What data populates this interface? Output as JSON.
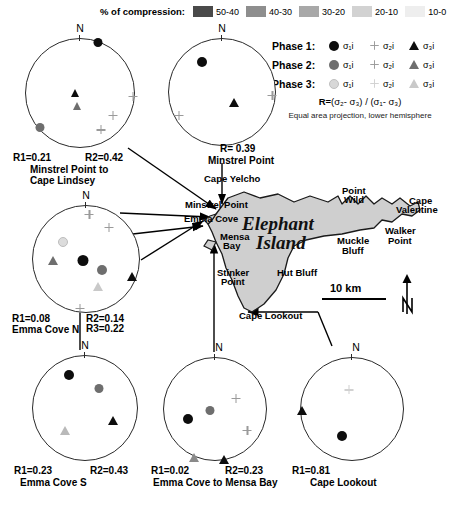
{
  "compression_legend": {
    "title": "% of compression:",
    "items": [
      {
        "label": "50-40",
        "color": "#4a4a4a"
      },
      {
        "label": "40-30",
        "color": "#8e8e8e"
      },
      {
        "label": "30-20",
        "color": "#a8a8a8"
      },
      {
        "label": "20-10",
        "color": "#d2d2d2"
      },
      {
        "label": "10-0",
        "color": "#eeeeee"
      }
    ]
  },
  "phase_legend": {
    "rows": [
      {
        "name": "Phase 1:",
        "s1": "σ₁i",
        "s2": "σ₂i",
        "s3": "σ₃i",
        "circle_color": "#0d0d0d",
        "plus_color": "#0d0d0d",
        "triangle_color": "#0d0d0d"
      },
      {
        "name": "Phase 2:",
        "s1": "σ₁i",
        "s2": "σ₂i",
        "s3": "σ₃i",
        "circle_color": "#6e6e6e",
        "plus_color": "#6e6e6e",
        "triangle_color": "#6e6e6e"
      },
      {
        "name": "Phase 3:",
        "s1": "σ₁i",
        "s2": "σ₂i",
        "s3": "σ₃i",
        "circle_color": "#d8d8d8",
        "plus_color": "#c8c8c8",
        "triangle_color": "#c9c9c9"
      }
    ],
    "formula_prefix": "R=",
    "formula_body": "(σ₂- σ₃) / (σ₁- σ₃)",
    "projection_note": "Equal area projection, lower hemisphere"
  },
  "stereonets": [
    {
      "id": "minstrel-point-to-cape-lindsey",
      "north_label": "N",
      "captions": [
        "R1=0.21",
        "R2=0.42"
      ],
      "name_lines": [
        "Minstrel Point to",
        "Cape Lindsey"
      ],
      "symbols": [
        {
          "type": "circle",
          "phase": 1,
          "x": 0.33,
          "y": -0.92
        },
        {
          "type": "triangle",
          "phase": 1,
          "x": -0.1,
          "y": -0.02
        },
        {
          "type": "triangle",
          "phase": 2,
          "x": -0.06,
          "y": 0.22
        },
        {
          "type": "circle",
          "phase": 2,
          "x": -0.73,
          "y": 0.62
        },
        {
          "type": "plus",
          "phase": 1,
          "x": 0.96,
          "y": 0.05
        },
        {
          "type": "plus",
          "phase": 2,
          "x": 0.6,
          "y": 0.4
        },
        {
          "type": "plus",
          "phase": 1,
          "x": 0.38,
          "y": 0.66
        }
      ]
    },
    {
      "id": "minstrel-point",
      "north_label": "N",
      "captions": [
        "R= 0.39"
      ],
      "name_lines": [
        "Minstrel Point"
      ],
      "symbols": [
        {
          "type": "circle",
          "phase": 1,
          "x": -0.37,
          "y": -0.55
        },
        {
          "type": "triangle",
          "phase": 1,
          "x": 0.22,
          "y": 0.18
        },
        {
          "type": "plus",
          "phase": 1,
          "x": 0.93,
          "y": 0.05
        },
        {
          "type": "plus",
          "phase": 1,
          "x": -0.8,
          "y": 0.42
        }
      ]
    },
    {
      "id": "emma-cove-n",
      "north_label": "N",
      "captions": [
        "R1=0.08",
        "R2=0.14",
        "R3=0.22"
      ],
      "name_lines": [
        "Emma Cove N"
      ],
      "symbols": [
        {
          "type": "circle",
          "phase": 3,
          "x": -0.42,
          "y": -0.32
        },
        {
          "type": "triangle",
          "phase": 2,
          "x": -0.62,
          "y": 0.02
        },
        {
          "type": "circle",
          "phase": 1,
          "x": -0.06,
          "y": 0.03
        },
        {
          "type": "circle",
          "phase": 2,
          "x": 0.3,
          "y": 0.2
        },
        {
          "type": "triangle",
          "phase": 1,
          "x": 0.86,
          "y": 0.32
        },
        {
          "type": "triangle",
          "phase": 3,
          "x": 0.22,
          "y": 0.5
        },
        {
          "type": "plus",
          "phase": 1,
          "x": 0.06,
          "y": -0.84
        },
        {
          "type": "plus",
          "phase": 2,
          "x": 0.42,
          "y": -0.6
        },
        {
          "type": "plus",
          "phase": 1,
          "x": -0.12,
          "y": 0.9
        }
      ]
    },
    {
      "id": "emma-cove-s",
      "north_label": "N",
      "captions": [
        "R1=0.23",
        "R2=0.43"
      ],
      "name_lines": [
        "Emma Cove S"
      ],
      "symbols": [
        {
          "type": "circle",
          "phase": 1,
          "x": -0.3,
          "y": -0.62
        },
        {
          "type": "circle",
          "phase": 2,
          "x": 0.26,
          "y": -0.38
        },
        {
          "type": "triangle",
          "phase": 1,
          "x": 0.52,
          "y": 0.22
        },
        {
          "type": "triangle",
          "phase": 3,
          "x": -0.38,
          "y": 0.42
        }
      ]
    },
    {
      "id": "emma-cove-to-mensa-bay",
      "north_label": "N",
      "captions": [
        "R1=0.02",
        "R2=0.23"
      ],
      "name_lines": [
        "Emma Cove to Mensa Bay"
      ],
      "symbols": [
        {
          "type": "circle",
          "phase": 2,
          "x": -0.1,
          "y": 0.02
        },
        {
          "type": "circle",
          "phase": 1,
          "x": -0.52,
          "y": 0.2
        },
        {
          "type": "plus",
          "phase": 1,
          "x": 0.4,
          "y": -0.22
        },
        {
          "type": "plus",
          "phase": 1,
          "x": 0.62,
          "y": 0.4
        },
        {
          "type": "triangle",
          "phase": 3,
          "x": -0.4,
          "y": 0.93
        },
        {
          "type": "triangle",
          "phase": 1,
          "x": 0.18,
          "y": 0.96
        }
      ]
    },
    {
      "id": "cape-lookout",
      "north_label": "N",
      "captions": [
        "R1=0.81"
      ],
      "name_lines": [
        "Cape Lookout"
      ],
      "symbols": [
        {
          "type": "triangle",
          "phase": 1,
          "x": -0.96,
          "y": 0.02
        },
        {
          "type": "circle",
          "phase": 1,
          "x": -0.2,
          "y": 0.52
        },
        {
          "type": "plus",
          "phase": 3,
          "x": -0.06,
          "y": -0.38
        }
      ]
    }
  ],
  "map": {
    "island_name_lines": [
      "Elephant",
      "Island"
    ],
    "places": [
      {
        "label": "Cape Yelcho",
        "x": 22,
        "y": 3
      },
      {
        "label": "Minstrel Point",
        "x": 4,
        "y": 28
      },
      {
        "label": "Emma Cove",
        "x": 2,
        "y": 42
      },
      {
        "label": "Mensa",
        "x": 38,
        "y": 59
      },
      {
        "label": "Bay",
        "x": 41,
        "y": 68
      },
      {
        "label": "Stinker",
        "x": 35,
        "y": 95
      },
      {
        "label": "Point",
        "x": 39,
        "y": 104
      },
      {
        "label": "Hut Bluff",
        "x": 95,
        "y": 95
      },
      {
        "label": "Cape Lookout",
        "x": 57,
        "y": 138
      },
      {
        "label": "Point",
        "x": 160,
        "y": 13
      },
      {
        "label": "Wild",
        "x": 162,
        "y": 22
      },
      {
        "label": "Muckle",
        "x": 155,
        "y": 63
      },
      {
        "label": "Bluff",
        "x": 160,
        "y": 73
      },
      {
        "label": "Cape",
        "x": 227,
        "y": 23
      },
      {
        "label": "Valentine",
        "x": 216,
        "y": 32
      },
      {
        "label": "Walker",
        "x": 205,
        "y": 53
      },
      {
        "label": "Point",
        "x": 208,
        "y": 63
      }
    ],
    "scalebar_label": "10 km",
    "compass_label": "N"
  }
}
